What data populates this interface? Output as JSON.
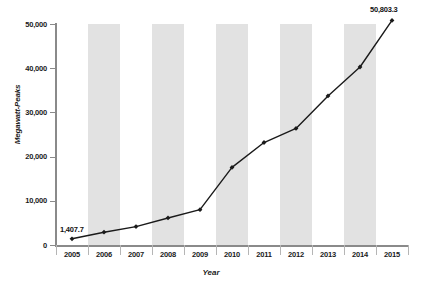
{
  "chart_data": {
    "type": "line",
    "title": "",
    "xlabel": "Year",
    "ylabel": "Megawatt-Peaks",
    "categories": [
      "2005",
      "2006",
      "2007",
      "2008",
      "2009",
      "2010",
      "2011",
      "2012",
      "2013",
      "2014",
      "2015"
    ],
    "values": [
      1407.7,
      2899.0,
      4170.0,
      6120.0,
      8000.0,
      17554.0,
      23185.0,
      26380.0,
      33720.0,
      40277.0,
      50803.3
    ],
    "ylim": [
      0,
      50000
    ],
    "ytick_labels": [
      "0",
      "10,000",
      "20,000",
      "30,000",
      "40,000",
      "50,000"
    ],
    "ytick_values": [
      0,
      10000,
      20000,
      30000,
      40000,
      50000
    ],
    "grid": false,
    "legend": "none",
    "banded_background": true,
    "band_color": "#e2e2e2",
    "line_color": "#1a1a1a",
    "marker": "diamond",
    "annotations": [
      {
        "label": "1,407.7",
        "category": "2005",
        "value": 1407.7
      },
      {
        "label": "50,803.3",
        "category": "2015",
        "value": 50803.3
      }
    ]
  }
}
